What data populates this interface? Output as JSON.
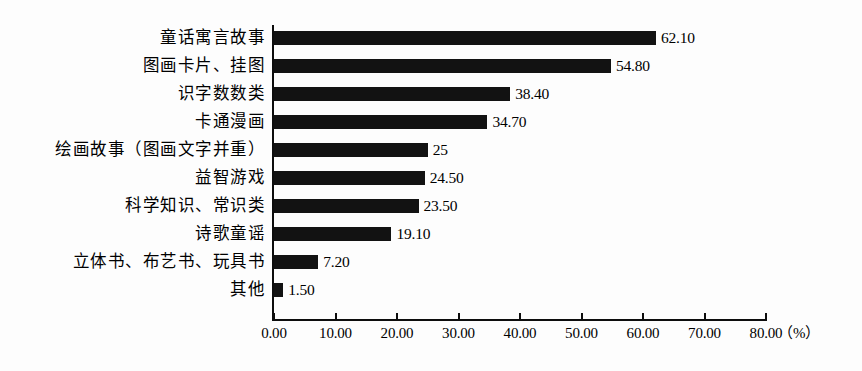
{
  "chart_data": {
    "type": "bar",
    "orientation": "horizontal",
    "title": "",
    "subtitle": "",
    "xlabel": "",
    "ylabel": "",
    "unit_label": "（%）",
    "xlim": [
      0,
      80
    ],
    "xticks": [
      "0.00",
      "10.00",
      "20.00",
      "30.00",
      "40.00",
      "50.00",
      "60.00",
      "70.00",
      "80.00"
    ],
    "xtick_values": [
      0,
      10,
      20,
      30,
      40,
      50,
      60,
      70,
      80
    ],
    "grid": false,
    "legend": false,
    "bar_color": "#121212",
    "background_color": "#fdfdfd",
    "axis_color": "#0d0d0d",
    "categories": [
      "童话寓言故事",
      "图画卡片、挂图",
      "识字数数类",
      "卡通漫画",
      "绘画故事（图画文字并重）",
      "益智游戏",
      "科学知识、常识类",
      "诗歌童谣",
      "立体书、布艺书、玩具书",
      "其他"
    ],
    "values": [
      62.1,
      54.8,
      38.4,
      34.7,
      25,
      24.5,
      23.5,
      19.1,
      7.2,
      1.5
    ],
    "value_labels": [
      "62.10",
      "54.80",
      "38.40",
      "34.70",
      "25",
      "24.50",
      "23.50",
      "19.10",
      "7.20",
      "1.50"
    ]
  }
}
